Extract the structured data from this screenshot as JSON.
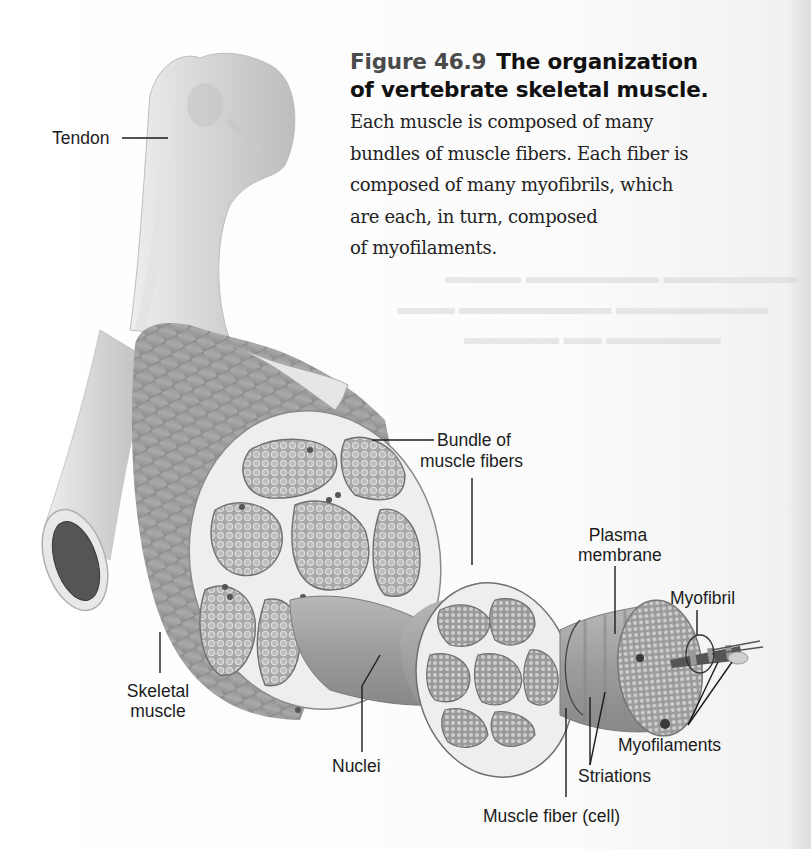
{
  "figure": {
    "number": "Figure 46.9",
    "title": "The organization",
    "title_line2": "of vertebrate skeletal muscle.",
    "body_lines": [
      "Each muscle is composed of many",
      "bundles of muscle fibers. Each fiber is",
      "composed of many myofibrils, which",
      "are each, in turn, composed",
      "of myofilaments."
    ]
  },
  "labels": {
    "tendon": "Tendon",
    "bundle_line1": "Bundle of",
    "bundle_line2": "muscle fibers",
    "plasma_line1": "Plasma",
    "plasma_line2": "membrane",
    "myofibril": "Myofibril",
    "skeletal_line1": "Skeletal",
    "skeletal_line2": "muscle",
    "nuclei": "Nuclei",
    "myofilaments": "Myofilaments",
    "striations": "Striations",
    "muscle_fiber": "Muscle fiber (cell)"
  },
  "colors": {
    "page_bg": "#ffffff",
    "bone": "#dcdcdc",
    "muscle": "#9a9a9a",
    "bundle_fill": "#b5b5b5",
    "connective": "#eeeeee",
    "label_text": "#1c1c1c",
    "figure_number": "#4a4a4a"
  }
}
